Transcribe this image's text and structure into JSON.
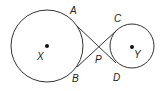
{
  "diagram": {
    "type": "geometry",
    "stroke_color": "#333333",
    "background": "#ffffff",
    "circles": [
      {
        "name": "X",
        "center": [
          47,
          46
        ],
        "radius": 36,
        "center_label": "X"
      },
      {
        "name": "Y",
        "center": [
          132,
          46
        ],
        "radius": 22,
        "center_label": "Y"
      }
    ],
    "tangent_lines": [
      {
        "name": "AD",
        "from": "A",
        "to": "D",
        "through": "P"
      },
      {
        "name": "BC",
        "from": "B",
        "to": "C",
        "through": "P"
      }
    ],
    "points": {
      "A": {
        "label": "A",
        "on": "circle X"
      },
      "B": {
        "label": "B",
        "on": "circle X"
      },
      "C": {
        "label": "C",
        "on": "circle Y"
      },
      "D": {
        "label": "D",
        "on": "circle Y"
      },
      "P": {
        "label": "P",
        "role": "intersection of tangents"
      }
    }
  }
}
